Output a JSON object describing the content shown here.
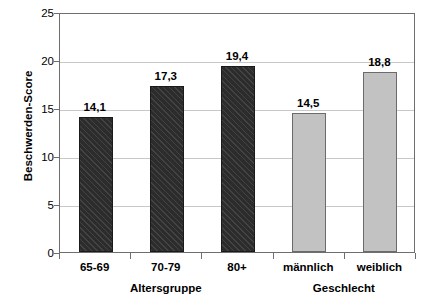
{
  "chart_data": {
    "type": "bar",
    "title": "",
    "xlabel": "",
    "ylabel": "Beschwerden-Score",
    "categories": [
      "65-69",
      "70-79",
      "80+",
      "männlich",
      "weiblich"
    ],
    "values": [
      14.1,
      17.3,
      19.4,
      14.5,
      18.8
    ],
    "value_labels": [
      "14,1",
      "17,3",
      "19,4",
      "14,5",
      "18,8"
    ],
    "series": [
      {
        "name": "Beschwerden-Score",
        "values": [
          14.1,
          17.3,
          19.4,
          14.5,
          18.8
        ]
      }
    ],
    "bar_styles": [
      "dark",
      "dark",
      "dark",
      "light",
      "light"
    ],
    "ylim": [
      0,
      25
    ],
    "ytick_values": [
      0,
      5,
      10,
      15,
      20,
      25
    ],
    "ytick_labels": [
      "0",
      "5",
      "10",
      "15",
      "20",
      "25"
    ],
    "grid": "horizontal",
    "legend": "none",
    "group_labels": [
      {
        "text": "Altersgruppe",
        "covers": [
          "65-69",
          "70-79",
          "80+"
        ]
      },
      {
        "text": "Geschlecht",
        "covers": [
          "männlich",
          "weiblich"
        ]
      }
    ],
    "colors": {
      "dark_bar": "#2c2c2c",
      "light_bar": "#c2c2c2",
      "grid": "#c8c8c8",
      "axis": "#6e6e6e",
      "text": "#000000",
      "background": "#ffffff"
    }
  }
}
